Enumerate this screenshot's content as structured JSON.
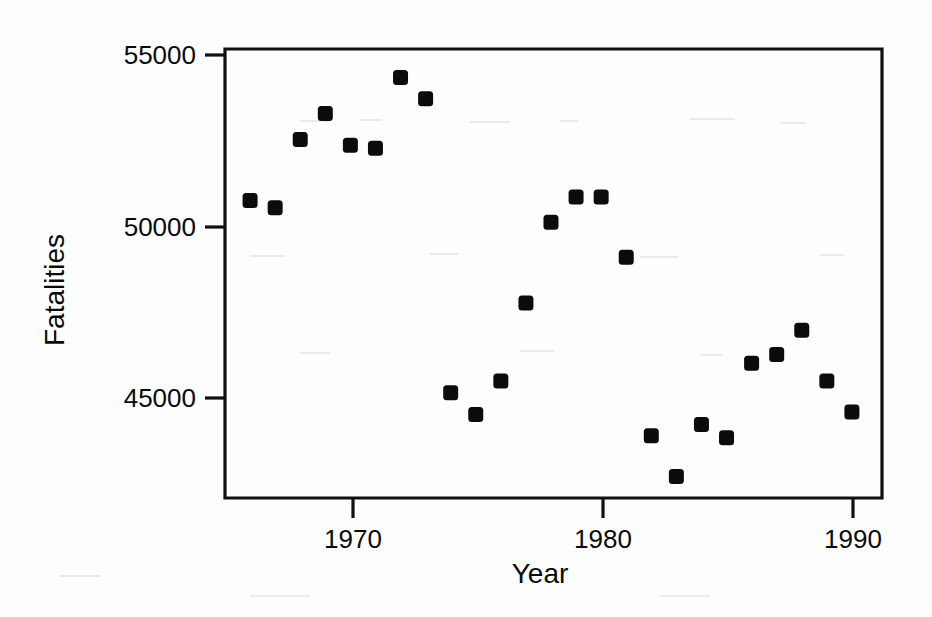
{
  "chart_data": {
    "type": "scatter",
    "title": "",
    "xlabel": "Year",
    "ylabel": "Fatalities",
    "xlim": [
      1965.0,
      1991.2
    ],
    "ylim": [
      42000,
      55430
    ],
    "grid": false,
    "legend": null,
    "x_ticks": [
      1970,
      1980,
      1990
    ],
    "x_tick_labels": [
      "1970",
      "1980",
      "1990"
    ],
    "y_ticks": [
      45000,
      50000,
      55000
    ],
    "y_tick_labels": [
      "45000",
      "50000",
      "55000"
    ],
    "marker": {
      "shape": "square",
      "color": "#0b0b0b",
      "size_px": 15
    },
    "x": [
      1966,
      1967,
      1968,
      1969,
      1970,
      1971,
      1972,
      1973,
      1974,
      1975,
      1976,
      1977,
      1978,
      1979,
      1980,
      1981,
      1982,
      1983,
      1984,
      1985,
      1986,
      1987,
      1988,
      1989,
      1990
    ],
    "y": [
      50900,
      50680,
      52720,
      53500,
      52550,
      52460,
      54580,
      53940,
      45150,
      44500,
      45500,
      47830,
      50250,
      51000,
      51000,
      49200,
      43860,
      42640,
      44200,
      43800,
      46030,
      46290,
      47020,
      45500,
      44570
    ],
    "points": [
      {
        "year": 1966,
        "fatalities": 50900
      },
      {
        "year": 1967,
        "fatalities": 50680
      },
      {
        "year": 1968,
        "fatalities": 52720
      },
      {
        "year": 1969,
        "fatalities": 53500
      },
      {
        "year": 1970,
        "fatalities": 52550
      },
      {
        "year": 1971,
        "fatalities": 52460
      },
      {
        "year": 1972,
        "fatalities": 54580
      },
      {
        "year": 1973,
        "fatalities": 53940
      },
      {
        "year": 1974,
        "fatalities": 45150
      },
      {
        "year": 1975,
        "fatalities": 44500
      },
      {
        "year": 1976,
        "fatalities": 45500
      },
      {
        "year": 1977,
        "fatalities": 47830
      },
      {
        "year": 1978,
        "fatalities": 50250
      },
      {
        "year": 1979,
        "fatalities": 51000
      },
      {
        "year": 1980,
        "fatalities": 51000
      },
      {
        "year": 1981,
        "fatalities": 49200
      },
      {
        "year": 1982,
        "fatalities": 43860
      },
      {
        "year": 1983,
        "fatalities": 42640
      },
      {
        "year": 1984,
        "fatalities": 44200
      },
      {
        "year": 1985,
        "fatalities": 43800
      },
      {
        "year": 1986,
        "fatalities": 46030
      },
      {
        "year": 1987,
        "fatalities": 46290
      },
      {
        "year": 1988,
        "fatalities": 47020
      },
      {
        "year": 1989,
        "fatalities": 45500
      },
      {
        "year": 1990,
        "fatalities": 44570
      }
    ]
  },
  "axis_titles": {
    "x": "Year",
    "y": "Fatalities"
  },
  "y_tick_labels": {
    "t0": "55000",
    "t1": "50000",
    "t2": "45000"
  },
  "x_tick_labels": {
    "t0": "1970",
    "t1": "1980",
    "t2": "1990"
  },
  "colors": {
    "marker": "#0b0b0b",
    "axis": "#101010",
    "background": "#fdfdfd"
  }
}
